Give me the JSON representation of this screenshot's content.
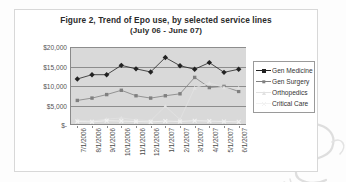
{
  "chart": {
    "title_line1": "Figure 2, Trend of Epo use, by selected service lines",
    "title_line2": "(July 06 - June 07)"
  },
  "legend": {
    "items": [
      {
        "label": "Gen Medicine",
        "color": "#222222",
        "marker": "diamond",
        "has_line": true
      },
      {
        "label": "Gen Surgery",
        "color": "#808080",
        "marker": "square",
        "has_line": true
      },
      {
        "label": "Orthopedics",
        "color": "#e2e2e2",
        "marker": "triangle",
        "has_line": true
      },
      {
        "label": "Critical Care",
        "color": "#f2f2f2",
        "marker": "x",
        "has_line": true
      }
    ]
  },
  "chart_data": {
    "type": "line",
    "title": "Figure 2, Trend of Epo use, by selected service lines (July 06 - June 07)",
    "xlabel": "",
    "ylabel": "",
    "ylim": [
      0,
      20000
    ],
    "yticks": [
      0,
      5000,
      10000,
      15000,
      20000
    ],
    "ytick_labels": [
      "$-",
      "$5,000",
      "$10,000",
      "$15,000",
      "$20,000"
    ],
    "grid": true,
    "legend_position": "right",
    "categories": [
      "7/1/2006",
      "8/1/2006",
      "9/1/2006",
      "10/1/2006",
      "11/1/2006",
      "12/1/2006",
      "1/1/2007",
      "2/1/2007",
      "3/1/2007",
      "4/1/2007",
      "5/1/2007",
      "6/1/2007"
    ],
    "series": [
      {
        "name": "Gen Medicine",
        "color": "#222222",
        "marker": "diamond",
        "values": [
          11800,
          12900,
          12900,
          15300,
          14400,
          13600,
          17300,
          15200,
          14300,
          16000,
          13500,
          14300
        ]
      },
      {
        "name": "Gen Surgery",
        "color": "#808080",
        "marker": "square",
        "values": [
          6300,
          6900,
          7800,
          8900,
          7500,
          6900,
          7500,
          8000,
          12200,
          9600,
          9900,
          8600
        ]
      },
      {
        "name": "Orthopedics",
        "color": "#e2e2e2",
        "marker": "triangle",
        "values": [
          1200,
          1000,
          1500,
          1800,
          1300,
          1100,
          4800,
          1400,
          9500,
          10800,
          9600,
          9500
        ]
      },
      {
        "name": "Critical Care",
        "color": "#f2f2f2",
        "marker": "x",
        "values": [
          900,
          800,
          1100,
          1000,
          900,
          800,
          1000,
          900,
          1100,
          1000,
          900,
          800
        ]
      }
    ]
  }
}
